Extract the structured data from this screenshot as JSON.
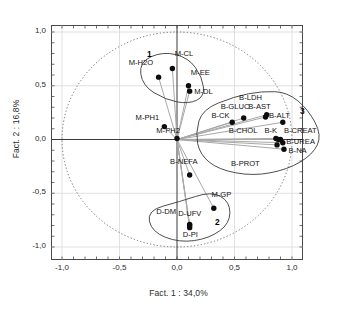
{
  "chart_data": {
    "type": "scatter",
    "title": "",
    "xlabel": "Fact. 1 : 34,0%",
    "ylabel": "Fact. 2 : 16,8%",
    "xlim": [
      -1.0,
      1.0
    ],
    "ylim": [
      -1.0,
      1.0
    ],
    "grid": true,
    "legend": "none",
    "unit_circle": true,
    "xticks": [
      "-1,0",
      "-0,5",
      "0,0",
      "0,5",
      "1,0"
    ],
    "xtick_values": [
      -1.0,
      -0.5,
      0.0,
      0.5,
      1.0
    ],
    "yticks": [
      "1,0",
      "0,5",
      "0,0",
      "-0,5",
      "-1,0"
    ],
    "ytick_values": [
      1.0,
      0.5,
      0.0,
      -0.5,
      -1.0
    ],
    "points": [
      {
        "label": "M-H2O",
        "x": -0.16,
        "y": 0.58,
        "lx": -0.42,
        "ly": 0.7
      },
      {
        "label": "M-CL",
        "x": -0.04,
        "y": 0.66,
        "lx": -0.02,
        "ly": 0.79
      },
      {
        "label": "M-EE",
        "x": 0.1,
        "y": 0.5,
        "lx": 0.12,
        "ly": 0.61
      },
      {
        "label": "M-DL",
        "x": 0.11,
        "y": 0.45,
        "lx": 0.15,
        "ly": 0.43
      },
      {
        "label": "M-PH1",
        "x": -0.11,
        "y": 0.12,
        "lx": -0.36,
        "ly": 0.19
      },
      {
        "label": "M-PH2",
        "x": 0.0,
        "y": 0.01,
        "lx": -0.18,
        "ly": 0.07
      },
      {
        "label": "B-CK",
        "x": 0.48,
        "y": 0.16,
        "lx": 0.3,
        "ly": 0.21
      },
      {
        "label": "B-GLUC",
        "x": 0.58,
        "y": 0.2,
        "lx": 0.38,
        "ly": 0.29
      },
      {
        "label": "B-AST",
        "x": 0.77,
        "y": 0.21,
        "lx": 0.62,
        "ly": 0.29
      },
      {
        "label": "B-LDH",
        "x": 0.78,
        "y": 0.23,
        "lx": 0.54,
        "ly": 0.38
      },
      {
        "label": "B-ALT",
        "x": 0.92,
        "y": 0.16,
        "lx": 0.8,
        "ly": 0.21
      },
      {
        "label": "B-CHOL",
        "x": 0.86,
        "y": 0.01,
        "lx": 0.45,
        "ly": 0.07
      },
      {
        "label": "B-K",
        "x": 0.88,
        "y": 0.0,
        "lx": 0.76,
        "ly": 0.07
      },
      {
        "label": "B-CREAT",
        "x": 0.9,
        "y": 0.0,
        "lx": 0.93,
        "ly": 0.07
      },
      {
        "label": "B-UREA",
        "x": 0.92,
        "y": -0.03,
        "lx": 0.95,
        "ly": -0.03
      },
      {
        "label": "B-NA",
        "x": 0.93,
        "y": -0.09,
        "lx": 0.97,
        "ly": -0.12
      },
      {
        "label": "B-PROT",
        "x": 0.87,
        "y": -0.05,
        "lx": 0.47,
        "ly": -0.24
      },
      {
        "label": "B-NEFA",
        "x": 0.11,
        "y": -0.33,
        "lx": -0.06,
        "ly": -0.22
      },
      {
        "label": "M-GP",
        "x": 0.32,
        "y": -0.64,
        "lx": 0.3,
        "ly": -0.53
      },
      {
        "label": "D-UFV",
        "x": 0.11,
        "y": -0.79,
        "lx": 0.01,
        "ly": -0.7
      },
      {
        "label": "D-PI",
        "x": 0.11,
        "y": -0.82,
        "lx": 0.05,
        "ly": -0.9
      },
      {
        "label": "D-DM",
        "x": 0.11,
        "y": -0.8,
        "lx": -0.18,
        "ly": -0.68
      }
    ],
    "cluster_labels": [
      {
        "name": "1",
        "x": -0.26,
        "y": 0.79
      },
      {
        "name": "2",
        "x": 0.33,
        "y": -0.78
      },
      {
        "name": "3",
        "x": 1.07,
        "y": 0.26
      }
    ]
  },
  "axes": {
    "x_title": "Fact. 1 : 34,0%",
    "y_title": "Fact. 2 : 16,8%"
  }
}
